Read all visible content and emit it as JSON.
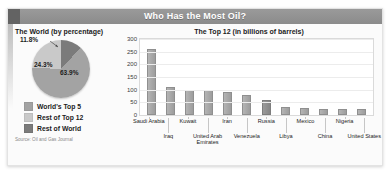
{
  "banner": {
    "title": "Who Has the Most Oil?"
  },
  "pie_panel": {
    "heading": "The World (by percentage)",
    "source": "Source: Oil and Gas Journal",
    "legend": [
      {
        "label": "World's Top 5",
        "color": "#a3a3a3"
      },
      {
        "label": "Rest of Top 12",
        "color": "#c9c9c9"
      },
      {
        "label": "Rest of World",
        "color": "#7b7b7b"
      }
    ]
  },
  "bar_panel": {
    "heading": "The Top 12 (in billions of barrels)"
  },
  "chart_data": [
    {
      "type": "pie",
      "title": "The World (by percentage)",
      "labels": [
        "World's Top 5",
        "Rest of Top 12",
        "Rest of World"
      ],
      "values": [
        63.9,
        24.3,
        11.8
      ],
      "value_labels": [
        "63.9%",
        "24.3%",
        "11.8%"
      ],
      "colors": [
        "#a3a3a3",
        "#c9c9c9",
        "#7b7b7b"
      ],
      "legend_position": "bottom-left",
      "annotations": [
        "Source: Oil and Gas Journal"
      ]
    },
    {
      "type": "bar",
      "title": "The Top 12 (in billions of barrels)",
      "xlabel": "",
      "ylabel": "",
      "ylim": [
        0,
        300
      ],
      "yticks": [
        0,
        50,
        100,
        150,
        200,
        250,
        300
      ],
      "ytick_labels": [
        "0",
        "50",
        "100",
        "150",
        "200",
        "250",
        "300"
      ],
      "grid": true,
      "categories": [
        "Saudi Arabia",
        "Iraq",
        "Kuwait",
        "United Arab Emirates",
        "Iran",
        "Venezuela",
        "Russia",
        "Libya",
        "Mexico",
        "China",
        "Nigeria",
        "United States"
      ],
      "values": [
        262,
        112,
        97,
        98,
        90,
        78,
        60,
        30,
        27,
        24,
        24,
        22
      ]
    }
  ]
}
